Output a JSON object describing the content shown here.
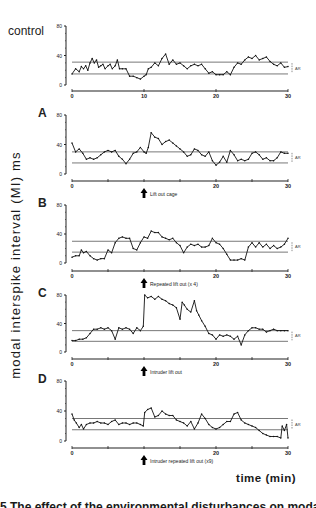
{
  "figure": {
    "y_axis_label": "modal interspike interval (MI) ms",
    "x_axis_label": "time (min)",
    "caption_fragment": "5 The effect of the environmental disturbances on modal"
  },
  "chart_data": [
    {
      "type": "line",
      "panel": "control",
      "label": "control",
      "xlim": [
        0,
        30
      ],
      "ylim": [
        0,
        80
      ],
      "xticks": [
        0,
        10,
        20,
        30
      ],
      "xtick_labels": [
        "0",
        "10",
        "20",
        "30"
      ],
      "yticks": [
        0,
        40,
        80
      ],
      "ytick_labels": [
        "0",
        "40",
        "80"
      ],
      "ar_band": {
        "upper": 31,
        "lower": 15,
        "label": "AR"
      },
      "arrow": null,
      "x": [
        0,
        0.5,
        1,
        1.3,
        1.6,
        1.9,
        2.2,
        2.5,
        2.8,
        3.1,
        3.4,
        3.7,
        4,
        4.3,
        4.6,
        5,
        5.3,
        5.6,
        6,
        6.3,
        6.6,
        7,
        7.5,
        8,
        8.5,
        9,
        9.5,
        10,
        10.3,
        10.6,
        11,
        11.5,
        12,
        12.5,
        13,
        13.5,
        14,
        14.5,
        15,
        15.5,
        16,
        16.5,
        17,
        17.5,
        18,
        18.5,
        19,
        19.5,
        20,
        20.5,
        21,
        21.5,
        22,
        22.5,
        23,
        23.5,
        24,
        24.5,
        25,
        25.5,
        26,
        26.5,
        27,
        27.5,
        28,
        28.5,
        29,
        29.5,
        30
      ],
      "y": [
        15,
        22,
        18,
        25,
        22,
        26,
        20,
        30,
        36,
        30,
        34,
        24,
        26,
        28,
        22,
        26,
        28,
        22,
        26,
        34,
        22,
        22,
        22,
        12,
        12,
        10,
        8,
        12,
        14,
        22,
        24,
        30,
        26,
        36,
        42,
        28,
        34,
        28,
        30,
        26,
        22,
        26,
        28,
        26,
        28,
        22,
        16,
        18,
        14,
        14,
        14,
        18,
        14,
        24,
        30,
        28,
        34,
        38,
        36,
        40,
        34,
        36,
        38,
        32,
        28,
        26,
        30,
        24,
        25
      ]
    },
    {
      "type": "line",
      "panel": "A",
      "label": "A",
      "xlim": [
        0,
        30
      ],
      "ylim": [
        0,
        80
      ],
      "xticks": [
        0,
        5,
        10,
        15,
        20,
        25,
        30
      ],
      "xtick_labels": [
        "0",
        "",
        "",
        "",
        "20",
        "",
        "30"
      ],
      "yticks": [
        0,
        40,
        80
      ],
      "ytick_labels": [
        "0",
        "40",
        "80"
      ],
      "ar_band": {
        "upper": 30,
        "lower": 15,
        "label": "AR"
      },
      "arrow": {
        "x": 10,
        "label": "Lift out cage"
      },
      "x": [
        0,
        0.5,
        1,
        1.5,
        2,
        2.5,
        3,
        3.5,
        4,
        4.5,
        5,
        5.5,
        6,
        6.5,
        7,
        7.5,
        8,
        8.5,
        9,
        9.5,
        10,
        10.3,
        10.6,
        11,
        11.5,
        12,
        12.5,
        13,
        13.5,
        14,
        14.5,
        15,
        15.5,
        16,
        16.5,
        17,
        17.5,
        18,
        18.5,
        19,
        19.5,
        20,
        20.5,
        21,
        21.5,
        22,
        22.5,
        23,
        23.5,
        24,
        24.5,
        25,
        25.5,
        26,
        26.5,
        27,
        27.5,
        28,
        28.5,
        29,
        29.5,
        30
      ],
      "y": [
        42,
        30,
        34,
        28,
        20,
        22,
        20,
        22,
        26,
        30,
        32,
        30,
        32,
        24,
        20,
        14,
        20,
        28,
        30,
        36,
        30,
        28,
        36,
        56,
        50,
        48,
        40,
        44,
        46,
        42,
        38,
        34,
        30,
        24,
        26,
        34,
        32,
        26,
        24,
        30,
        18,
        12,
        16,
        24,
        16,
        32,
        26,
        18,
        20,
        18,
        20,
        28,
        30,
        26,
        20,
        22,
        18,
        18,
        22,
        30,
        28,
        28
      ]
    },
    {
      "type": "line",
      "panel": "B",
      "label": "B",
      "xlim": [
        0,
        30
      ],
      "ylim": [
        0,
        80
      ],
      "xticks": [
        0,
        5,
        10,
        15,
        20,
        25,
        30
      ],
      "xtick_labels": [
        "0",
        "",
        "",
        "",
        "20",
        "",
        "30"
      ],
      "yticks": [
        0,
        40,
        80
      ],
      "ytick_labels": [
        "0",
        "40",
        "80"
      ],
      "ar_band": {
        "upper": 30,
        "lower": 15,
        "label": "AR"
      },
      "arrow": {
        "x": 10,
        "label": "Repeated lift out (x 4)"
      },
      "x": [
        0,
        0.5,
        1,
        1.3,
        1.6,
        2,
        2.5,
        3,
        3.5,
        4,
        4.5,
        5,
        5.5,
        6,
        6.5,
        7,
        7.5,
        8,
        8.5,
        9,
        9.5,
        10,
        10.5,
        11,
        11.5,
        12,
        12.5,
        13,
        13.5,
        14,
        14.5,
        15,
        15.5,
        16,
        16.5,
        17,
        17.5,
        18,
        18.5,
        19,
        19.5,
        20,
        20.5,
        21,
        21.5,
        22,
        22.5,
        23,
        23.5,
        24,
        24.5,
        25,
        25.5,
        26,
        26.5,
        27,
        27.5,
        28,
        28.5,
        29,
        29.5,
        30
      ],
      "y": [
        8,
        10,
        10,
        18,
        14,
        16,
        10,
        6,
        4,
        6,
        6,
        18,
        14,
        28,
        34,
        36,
        34,
        34,
        20,
        18,
        28,
        36,
        34,
        44,
        42,
        42,
        36,
        34,
        32,
        34,
        28,
        24,
        14,
        22,
        26,
        24,
        26,
        22,
        22,
        24,
        34,
        28,
        26,
        20,
        12,
        4,
        4,
        4,
        6,
        4,
        22,
        28,
        22,
        28,
        22,
        26,
        20,
        24,
        20,
        22,
        26,
        34
      ]
    },
    {
      "type": "line",
      "panel": "C",
      "label": "C",
      "xlim": [
        0,
        30
      ],
      "ylim": [
        0,
        80
      ],
      "xticks": [
        0,
        5,
        10,
        15,
        20,
        25,
        30
      ],
      "xtick_labels": [
        "0",
        "",
        "",
        "",
        "20",
        "",
        "30"
      ],
      "yticks": [
        0,
        40,
        80
      ],
      "ytick_labels": [
        "0",
        "40",
        "80"
      ],
      "ar_band": {
        "upper": 30,
        "lower": 15,
        "label": "AR"
      },
      "arrow": {
        "x": 10,
        "label": "Intruder lift out"
      },
      "x": [
        0,
        0.5,
        1,
        1.5,
        2,
        2.5,
        3,
        3.5,
        4,
        4.5,
        5,
        5.5,
        6,
        6.5,
        7,
        7.5,
        8,
        8.5,
        9,
        9.5,
        9.9,
        10.1,
        10.5,
        11,
        11.5,
        12,
        12.5,
        13,
        13.5,
        14,
        14.5,
        15,
        15.3,
        15.6,
        16,
        16.5,
        17,
        17.3,
        17.6,
        18,
        18.5,
        19,
        19.5,
        20,
        20.5,
        21,
        21.5,
        22,
        22.5,
        23,
        23.5,
        24,
        24.5,
        25,
        25.5,
        26,
        26.5,
        27,
        27.5,
        28,
        28.5,
        29,
        29.5,
        30
      ],
      "y": [
        16,
        16,
        18,
        18,
        20,
        26,
        32,
        32,
        34,
        32,
        34,
        30,
        18,
        34,
        32,
        34,
        32,
        26,
        34,
        30,
        36,
        80,
        76,
        78,
        74,
        78,
        74,
        72,
        68,
        66,
        62,
        46,
        70,
        66,
        60,
        56,
        72,
        58,
        52,
        44,
        36,
        26,
        24,
        18,
        24,
        22,
        24,
        22,
        18,
        22,
        10,
        24,
        30,
        34,
        34,
        32,
        32,
        28,
        30,
        32,
        30,
        30,
        30,
        30
      ]
    },
    {
      "type": "line",
      "panel": "D",
      "label": "D",
      "xlim": [
        0,
        30
      ],
      "ylim": [
        0,
        80
      ],
      "xticks": [
        0,
        5,
        10,
        15,
        20,
        25,
        30
      ],
      "xtick_labels": [
        "0",
        "",
        "",
        "",
        "20",
        "",
        "30"
      ],
      "yticks": [
        0,
        40,
        80
      ],
      "ytick_labels": [
        "0",
        "40",
        "80"
      ],
      "ar_band": {
        "upper": 30,
        "lower": 15,
        "label": "AR"
      },
      "arrow": {
        "x": 10,
        "label": "Intruder repeated lift out (x9)"
      },
      "x": [
        0,
        0.3,
        0.6,
        1,
        1.3,
        1.6,
        2,
        2.5,
        3,
        3.5,
        4,
        4.5,
        5,
        5.5,
        6,
        6.5,
        7,
        7.5,
        8,
        8.5,
        9,
        9.5,
        9.9,
        10.1,
        10.5,
        11,
        11.5,
        12,
        12.5,
        13,
        13.5,
        14,
        14.5,
        15,
        15.5,
        16,
        16.5,
        17,
        17.5,
        18,
        18.5,
        19,
        19.5,
        20,
        20.5,
        21,
        21.5,
        22,
        22.5,
        23,
        23.5,
        24,
        24.5,
        25,
        25.5,
        26,
        26.5,
        27,
        27.5,
        28,
        28.5,
        29,
        29.2,
        29.5,
        29.8,
        30
      ],
      "y": [
        36,
        28,
        24,
        18,
        22,
        16,
        22,
        24,
        24,
        26,
        24,
        24,
        22,
        26,
        28,
        22,
        24,
        24,
        22,
        24,
        24,
        22,
        20,
        38,
        42,
        44,
        32,
        34,
        40,
        36,
        34,
        34,
        28,
        26,
        24,
        20,
        26,
        16,
        24,
        36,
        30,
        22,
        18,
        16,
        18,
        22,
        26,
        26,
        36,
        38,
        28,
        24,
        22,
        20,
        18,
        14,
        10,
        8,
        6,
        6,
        6,
        4,
        20,
        14,
        22,
        4
      ]
    }
  ]
}
